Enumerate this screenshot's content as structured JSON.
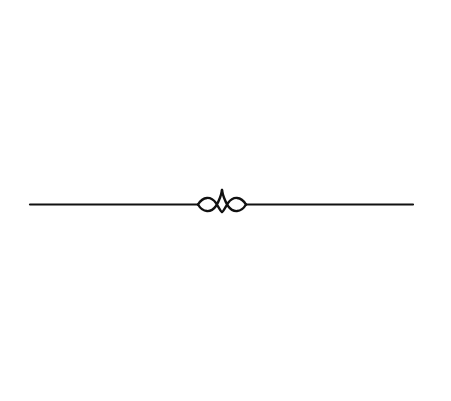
{
  "divider": {
    "style": "ornamental-flourish",
    "color": "#111111",
    "background": "#ffffff"
  }
}
